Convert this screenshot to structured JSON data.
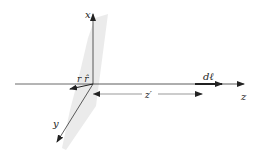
{
  "diagram": {
    "axes": {
      "x_label": "x",
      "y_label": "y",
      "z_label": "z"
    },
    "labels": {
      "r_vec": "r r̂",
      "dl": "dℓ",
      "z_prime": "z′"
    },
    "colors": {
      "line": "#333333",
      "plane": "#e6e6e6"
    }
  }
}
